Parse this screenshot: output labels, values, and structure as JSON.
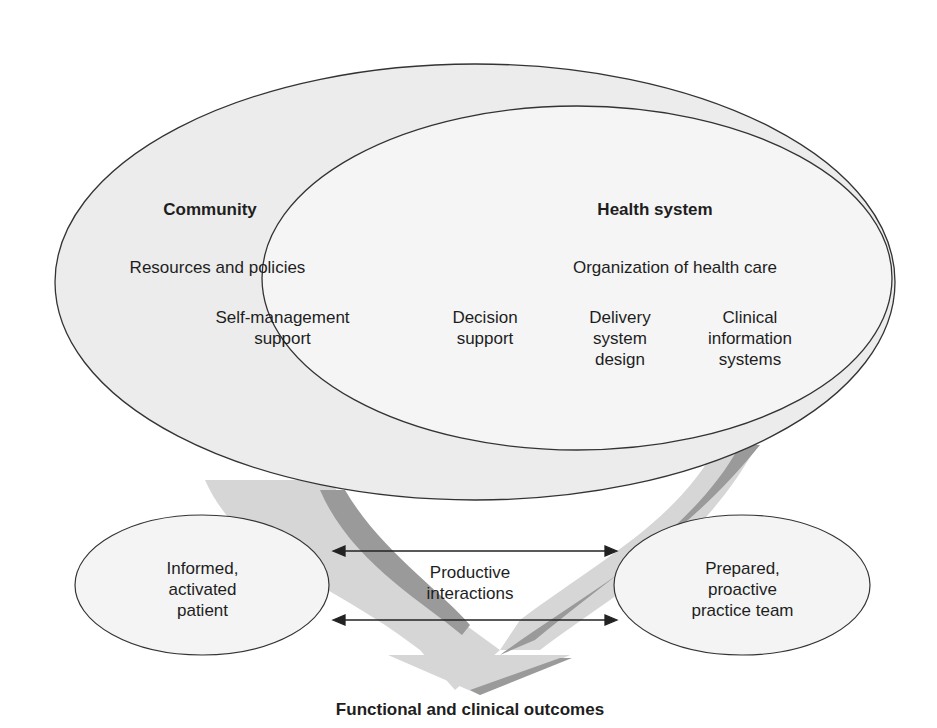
{
  "diagram": {
    "colors": {
      "outer_ellipse_fill": "#ececec",
      "inner_ellipse_fill": "#f5f5f5",
      "arrow_light": "#d6d6d6",
      "arrow_dark": "#9a9a9a",
      "outline": "#333333",
      "background": "#ffffff"
    },
    "community": {
      "heading": "Community",
      "subheading": "Resources and policies"
    },
    "health_system": {
      "heading": "Health system",
      "subheading": "Organization of health care"
    },
    "elements": [
      {
        "label": "Self-management\nsupport"
      },
      {
        "label": "Decision\nsupport"
      },
      {
        "label": "Delivery\nsystem\ndesign"
      },
      {
        "label": "Clinical\ninformation\nsystems"
      }
    ],
    "patient": {
      "label": "Informed,\nactivated\npatient"
    },
    "team": {
      "label": "Prepared,\nproactive\npractice team"
    },
    "interactions": {
      "label": "Productive\ninteractions"
    },
    "outcomes": {
      "label": "Functional and clinical outcomes"
    }
  }
}
